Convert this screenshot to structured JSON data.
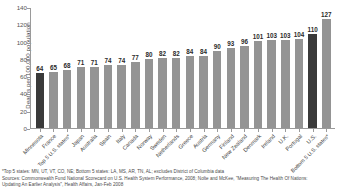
{
  "chart_data": {
    "type": "bar",
    "title": "",
    "xlabel": "",
    "ylabel": "Deaths per 100,000 population",
    "ylim": [
      0,
      140
    ],
    "ytick_labels": [
      "140",
      "120",
      "100",
      "80",
      "60",
      "40",
      "20",
      "0"
    ],
    "ytick_values": [
      140,
      120,
      100,
      80,
      60,
      40,
      20,
      0
    ],
    "grid": false,
    "legend": "none",
    "categories": [
      "Minnesota",
      "France",
      "Top 5 U.S. states*",
      "Japan",
      "Australia",
      "Spain",
      "Italy",
      "Canada",
      "Norway",
      "Sweden",
      "Netherlands",
      "Greece",
      "Austria",
      "Germany",
      "Finland",
      "New Zealand",
      "Denmark",
      "Ireland",
      "U.K.",
      "Portugal",
      "U.S.",
      "Bottom 5 U.S. states*"
    ],
    "values": [
      64,
      65,
      68,
      71,
      71,
      74,
      74,
      77,
      80,
      82,
      82,
      84,
      84,
      90,
      93,
      96,
      101,
      103,
      103,
      104,
      110,
      127
    ],
    "bar_styles": [
      "dark",
      "light",
      "light",
      "light",
      "light",
      "light",
      "light",
      "light",
      "light",
      "light",
      "light",
      "light",
      "light",
      "light",
      "light",
      "light",
      "light",
      "light",
      "light",
      "light",
      "dark",
      "light"
    ],
    "colors": {
      "bar_light": "#949494",
      "bar_dark": "#3a3a3a",
      "axis": "#9a9a9a",
      "text": "#3d3d3d"
    }
  },
  "footnotes": [
    "*Top 5 states: MN, UT, VT, CO, NE; Bottom 5 states: LA, MS, AR, TN, AL; excludes District of Columbia data",
    "Sources: Commonwealth Fund National Scorecard on U.S. Health System Performance, 2008; Nolte and McKee, \"Measuring The Health Of Nations:",
    "Updating An Earlier Analysis\", Health Affairs, Jan-Feb 2008"
  ]
}
